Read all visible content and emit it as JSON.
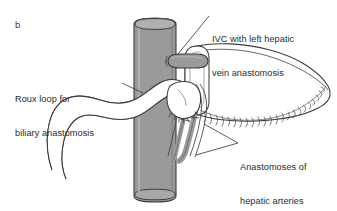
{
  "figure": {
    "panel_label": "b",
    "background_color": "#ffffff",
    "width": 337,
    "height": 211,
    "line_color": "#3c3c3c",
    "vessel_fill": "#9a9a9a",
    "organ_fill": "#ffffff",
    "text_color": "#2b2b2b"
  },
  "annotations": {
    "ivc": {
      "line1": "IVC with left hepatic",
      "line2": "vein anastomosis"
    },
    "roux": {
      "line1": "Roux loop for",
      "line2": "biliary anastomosis"
    },
    "anastomoses": {
      "line1": "Anastomoses of",
      "line2": "hepatic arteries",
      "line3": "and portal veins"
    }
  },
  "structures": [
    {
      "name": "inferior-vena-cava",
      "fill": "#9a9a9a"
    },
    {
      "name": "left-hepatic-vein-stump",
      "fill": "#9a9a9a"
    },
    {
      "name": "liver-graft",
      "fill": "#ffffff"
    },
    {
      "name": "roux-loop-bowel",
      "fill": "#ffffff"
    },
    {
      "name": "hepatic-artery-portal-vein-bundle",
      "fill": "#9a9a9a"
    }
  ]
}
